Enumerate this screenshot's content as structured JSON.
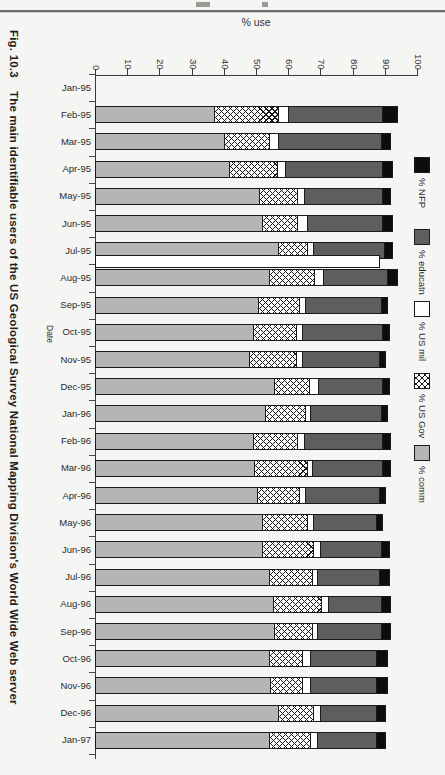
{
  "page": {
    "figure_number": "Fig. 10.3",
    "caption": "The main identifiable users of the US Geological Survey National Mapping Division's World Wide Web server"
  },
  "chart_data": {
    "type": "bar",
    "orientation": "horizontal",
    "stacked": true,
    "value_axis_title": "% use",
    "category_axis_title": "Date",
    "value_ticks": [
      0,
      10,
      20,
      30,
      40,
      50,
      60,
      70,
      80,
      90,
      100
    ],
    "value_range": [
      0,
      100
    ],
    "grid": false,
    "legend_position": "right",
    "legend_order_top_to_bottom": [
      "% NFP",
      "% educatn",
      "% US mil",
      "% US Gov",
      "% comm"
    ],
    "categories": [
      "Jan-95",
      "Feb-95",
      "Mar-95",
      "Apr-95",
      "May-95",
      "Jun-95",
      "Jul-95",
      "Aug-95",
      "Sep-95",
      "Oct-95",
      "Nov-95",
      "Dec-95",
      "Jan-96",
      "Feb-96",
      "Mar-96",
      "Apr-96",
      "May-96",
      "Jun-96",
      "Jul-96",
      "Aug-96",
      "Sep-96",
      "Oct-96",
      "Nov-96",
      "Dec-96",
      "Jan-97"
    ],
    "series": [
      {
        "name": "% comm",
        "key": "comm",
        "color": "#b5b5b5",
        "pattern": "solid",
        "values": [
          0,
          37,
          40,
          41.5,
          51,
          52,
          57,
          54,
          50.5,
          49,
          48,
          55.5,
          53,
          49,
          49.5,
          50.5,
          52,
          52,
          54,
          55.5,
          55.5,
          54,
          54.5,
          57,
          54
        ]
      },
      {
        "name": "% US Gov",
        "key": "gov",
        "color": "#ffffff",
        "pattern": "crosshatch",
        "values": [
          0,
          20,
          14,
          15,
          12,
          11,
          9,
          14,
          13,
          13.5,
          14.5,
          11,
          12.5,
          14,
          16.5,
          13,
          14,
          16,
          13.5,
          15,
          12,
          10.5,
          10,
          11,
          13
        ]
      },
      {
        "name": "% US mil",
        "key": "mil",
        "color": "#ffffff",
        "pattern": "solid",
        "values": [
          0,
          3,
          3,
          2.5,
          2,
          3,
          2,
          3,
          2,
          2,
          2,
          3,
          1.5,
          2,
          1.5,
          2,
          2,
          2,
          1.5,
          2,
          1.5,
          2.5,
          2.5,
          2,
          2
        ]
      },
      {
        "name": "% educatn",
        "key": "educatn",
        "color": "#5e5e5e",
        "pattern": "solid",
        "values": [
          0,
          29.5,
          32,
          30.5,
          24.5,
          23.5,
          22,
          20,
          23.5,
          25,
          24,
          20,
          22,
          24.5,
          22,
          23,
          19.5,
          19,
          19.5,
          16.5,
          20,
          20.5,
          20.5,
          17.5,
          18.5
        ]
      },
      {
        "name": "% NFP",
        "key": "nfp",
        "color": "#0d0d0d",
        "pattern": "solid",
        "values": [
          0,
          4.5,
          3,
          3,
          2.5,
          3,
          2.5,
          3,
          2,
          2,
          2,
          2,
          2,
          2.5,
          2.5,
          2,
          2,
          2.5,
          3,
          3,
          3,
          3.5,
          3.5,
          3,
          3
        ]
      }
    ],
    "annotations": [
      {
        "category": "Aug-95",
        "type": "extra-outlined-white-bar",
        "value": 88.5,
        "fill": "#ffffff"
      }
    ]
  }
}
